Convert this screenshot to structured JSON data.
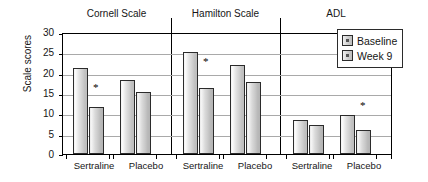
{
  "chart_data": {
    "type": "bar",
    "title": "",
    "xlabel": "",
    "ylabel": "Scale scores",
    "ylim": [
      0,
      30
    ],
    "yticks": [
      0,
      5,
      10,
      15,
      20,
      25,
      30
    ],
    "grid": true,
    "legend_position": "right",
    "group_titles": [
      "Cornell Scale",
      "Hamilton Scale",
      "ADL"
    ],
    "categories": [
      "Sertraline",
      "Placebo",
      "Sertraline",
      "Placebo",
      "Sertraline",
      "Placebo"
    ],
    "series": [
      {
        "name": "Baseline",
        "values": [
          21.2,
          18.1,
          25.0,
          21.8,
          8.3,
          9.7
        ]
      },
      {
        "name": "Week 9",
        "values": [
          11.5,
          15.3,
          16.2,
          17.6,
          7.2,
          6.0
        ]
      }
    ],
    "annotations": [
      {
        "text": "*",
        "group": "Cornell Scale",
        "category": "Sertraline",
        "series": "Week 9",
        "y": 16.8
      },
      {
        "text": "*",
        "group": "Hamilton Scale",
        "category": "Sertraline",
        "series": "Week 9",
        "y": 23.0
      },
      {
        "text": "*",
        "group": "ADL",
        "category": "Placebo",
        "series": "Week 9",
        "y": 12.2
      }
    ]
  },
  "axis": {
    "y_title": "Scale scores",
    "y_tick_labels": [
      "30",
      "25",
      "20",
      "15",
      "10",
      "5",
      "0"
    ]
  },
  "groups": [
    {
      "label": "Cornell Scale"
    },
    {
      "label": "Hamilton Scale"
    },
    {
      "label": "ADL"
    }
  ],
  "x_categories": [
    {
      "label": "Sertraline"
    },
    {
      "label": "Placebo"
    },
    {
      "label": "Sertraline"
    },
    {
      "label": "Placebo"
    },
    {
      "label": "Sertraline"
    },
    {
      "label": "Placebo"
    }
  ],
  "legend": {
    "items": [
      {
        "label": "Baseline"
      },
      {
        "label": "Week 9"
      }
    ]
  },
  "colors": {
    "baseline_fill": "#dcdcdc",
    "week9_fill": "#c8c8c8",
    "bar_outline": "#2b2b2b",
    "grid": "#a9a9a9",
    "axis": "#000000",
    "text": "#161616"
  }
}
